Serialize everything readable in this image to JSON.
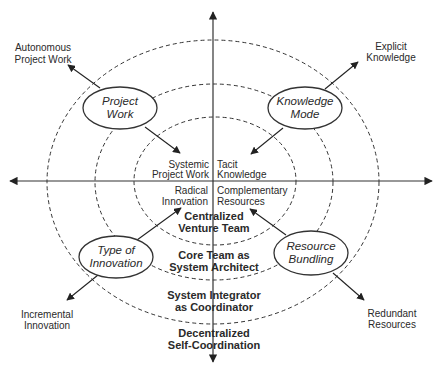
{
  "diagram": {
    "center_labels": {
      "top_left": [
        "Systemic",
        "Project Work"
      ],
      "top_right": [
        "Tacit",
        "Knowledge"
      ],
      "bottom_left": [
        "Radical",
        "Innovation"
      ],
      "bottom_right": [
        "Complementary",
        "Resources"
      ]
    },
    "rings": [
      {
        "level": 1,
        "label": [
          "Centralized",
          "Venture Team"
        ]
      },
      {
        "level": 2,
        "label": [
          "Core Team as",
          "System Architect"
        ]
      },
      {
        "level": 3,
        "label": [
          "System Integrator",
          "as Coordinator"
        ]
      },
      {
        "level": 4,
        "label": [
          "Decentralized",
          "Self-Coordination"
        ]
      }
    ],
    "dimensions": [
      {
        "name": [
          "Project",
          "Work"
        ],
        "outer_pole": [
          "Autonomous",
          "Project Work"
        ],
        "inner_pole": [
          "Systemic",
          "Project Work"
        ]
      },
      {
        "name": [
          "Knowledge",
          "Mode"
        ],
        "outer_pole": [
          "Explicit",
          "Knowledge"
        ],
        "inner_pole": [
          "Tacit",
          "Knowledge"
        ]
      },
      {
        "name": [
          "Type of",
          "Innovation"
        ],
        "outer_pole": [
          "Incremental",
          "Innovation"
        ],
        "inner_pole": [
          "Radical",
          "Innovation"
        ]
      },
      {
        "name": [
          "Resource",
          "Bundling"
        ],
        "outer_pole": [
          "Redundant",
          "Resources"
        ],
        "inner_pole": [
          "Complementary",
          "Resources"
        ]
      }
    ]
  }
}
